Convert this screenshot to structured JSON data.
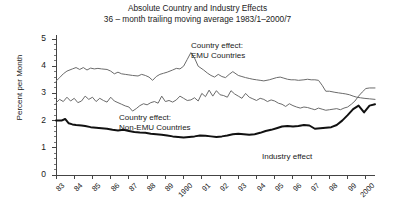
{
  "chart_data": {
    "type": "line",
    "title": "Absolute Country and Industry Effects",
    "subtitle": "36 – month trailing moving average 1983/1–2000/7",
    "xlabel": "",
    "ylabel": "Percent per Month",
    "ylim": [
      0,
      5
    ],
    "yticks": [
      0,
      1,
      2,
      3,
      4,
      5
    ],
    "ytick_labels": [
      "0",
      "1",
      "2",
      "3",
      "4",
      "5"
    ],
    "xlim": [
      1983,
      2000.5
    ],
    "xtick_labels": [
      "83",
      "84",
      "85",
      "86",
      "87",
      "88",
      "89",
      "1990",
      "91",
      "92",
      "93",
      "94",
      "95",
      "96",
      "97",
      "98",
      "99",
      "2000"
    ],
    "xticks": [
      1983,
      1984,
      1985,
      1986,
      1987,
      1988,
      1989,
      1990,
      1991,
      1992,
      1993,
      1994,
      1995,
      1996,
      1997,
      1998,
      1999,
      2000
    ],
    "grid": false,
    "legend_position": "inline-annotations",
    "annotations": [
      {
        "id": "emu",
        "text_line1": "Country effect:",
        "text_line2": "EMU Countries",
        "x": 191,
        "y": 41
      },
      {
        "id": "nonemu",
        "text_line1": "Country effect:",
        "text_line2": "Non-EMU Countries",
        "x": 119,
        "y": 113
      },
      {
        "id": "industry",
        "text_line1": "Industry effect",
        "text_line2": "",
        "x": 262,
        "y": 152
      }
    ],
    "series": [
      {
        "name": "Country effect: EMU Countries",
        "color": "#6b6b6b",
        "width": 1,
        "x": [
          1983.0,
          1983.2,
          1983.4,
          1983.6,
          1983.9,
          1984.1,
          1984.3,
          1984.5,
          1984.7,
          1984.9,
          1985.1,
          1985.3,
          1985.5,
          1985.8,
          1986.0,
          1986.2,
          1986.4,
          1986.6,
          1986.8,
          1987.0,
          1987.2,
          1987.5,
          1987.7,
          1987.9,
          1988.1,
          1988.3,
          1988.5,
          1988.7,
          1988.9,
          1989.1,
          1989.4,
          1989.6,
          1989.8,
          1990.0,
          1990.2,
          1990.4,
          1990.6,
          1990.8,
          1991.1,
          1991.3,
          1991.5,
          1991.7,
          1991.9,
          1992.1,
          1992.3,
          1992.5,
          1992.7,
          1993.0,
          1993.2,
          1993.4,
          1993.6,
          1993.8,
          1994.0,
          1994.2,
          1994.4,
          1994.7,
          1994.9,
          1995.1,
          1995.3,
          1995.5,
          1995.7,
          1995.9,
          1996.1,
          1996.3,
          1996.6,
          1996.8,
          1997.0,
          1997.2,
          1997.4,
          1997.6,
          1997.8,
          1998.0,
          1998.3,
          1998.5,
          1998.7,
          1998.9,
          1999.1,
          1999.3,
          1999.5,
          1999.7,
          1999.9,
          2000.2,
          2000.5
        ],
        "y": [
          3.45,
          3.58,
          3.72,
          3.82,
          3.9,
          3.95,
          3.88,
          3.95,
          3.86,
          3.93,
          3.9,
          3.92,
          3.9,
          3.88,
          3.82,
          3.72,
          3.78,
          3.72,
          3.7,
          3.68,
          3.66,
          3.64,
          3.7,
          3.66,
          3.6,
          3.48,
          3.62,
          3.7,
          3.74,
          3.78,
          3.86,
          3.92,
          3.9,
          4.0,
          4.25,
          4.5,
          4.3,
          4.0,
          3.86,
          3.75,
          3.66,
          3.6,
          3.7,
          3.62,
          3.58,
          3.7,
          3.8,
          3.66,
          3.62,
          3.58,
          3.55,
          3.52,
          3.5,
          3.48,
          3.46,
          3.5,
          3.54,
          3.58,
          3.6,
          3.56,
          3.52,
          3.5,
          3.5,
          3.48,
          3.5,
          3.52,
          3.5,
          3.5,
          3.48,
          3.3,
          3.08,
          3.08,
          3.04,
          3.02,
          3.0,
          2.98,
          2.95,
          2.9,
          2.86,
          2.84,
          2.82,
          2.8,
          2.78
        ]
      },
      {
        "name": "Country effect: Non-EMU Countries",
        "color": "#6b6b6b",
        "width": 1,
        "x": [
          1983.0,
          1983.2,
          1983.4,
          1983.6,
          1983.8,
          1984.0,
          1984.2,
          1984.4,
          1984.6,
          1984.8,
          1985.0,
          1985.2,
          1985.4,
          1985.6,
          1985.8,
          1986.0,
          1986.2,
          1986.4,
          1986.6,
          1986.8,
          1987.0,
          1987.2,
          1987.4,
          1987.6,
          1987.8,
          1988.0,
          1988.2,
          1988.4,
          1988.6,
          1988.8,
          1989.0,
          1989.2,
          1989.4,
          1989.6,
          1989.8,
          1990.0,
          1990.2,
          1990.4,
          1990.6,
          1990.8,
          1991.0,
          1991.2,
          1991.4,
          1991.6,
          1991.8,
          1992.0,
          1992.2,
          1992.4,
          1992.6,
          1992.8,
          1993.0,
          1993.2,
          1993.4,
          1993.6,
          1993.8,
          1994.0,
          1994.2,
          1994.4,
          1994.6,
          1994.8,
          1995.0,
          1995.2,
          1995.4,
          1995.6,
          1995.8,
          1996.0,
          1996.2,
          1996.4,
          1996.6,
          1996.8,
          1997.0,
          1997.2,
          1997.4,
          1997.6,
          1997.8,
          1998.0,
          1998.2,
          1998.4,
          1998.6,
          1998.8,
          1999.0,
          1999.2,
          1999.4,
          1999.6,
          1999.8,
          2000.0,
          2000.2,
          2000.5
        ],
        "y": [
          2.65,
          2.78,
          2.7,
          2.86,
          2.72,
          2.82,
          2.66,
          2.72,
          2.9,
          2.78,
          2.86,
          2.7,
          2.82,
          2.74,
          2.68,
          2.86,
          2.72,
          2.66,
          2.6,
          2.54,
          2.5,
          2.35,
          2.44,
          2.55,
          2.62,
          2.58,
          2.66,
          2.7,
          2.64,
          2.9,
          2.7,
          2.74,
          2.68,
          2.76,
          2.9,
          2.82,
          2.74,
          2.76,
          2.84,
          2.72,
          3.0,
          2.88,
          3.12,
          2.9,
          3.1,
          2.95,
          2.92,
          2.86,
          3.1,
          2.98,
          2.9,
          2.82,
          3.0,
          2.86,
          2.8,
          2.74,
          2.82,
          2.78,
          2.7,
          2.76,
          2.72,
          2.64,
          2.6,
          2.52,
          2.62,
          2.55,
          2.5,
          2.46,
          2.5,
          2.48,
          2.44,
          2.4,
          2.46,
          2.42,
          2.38,
          2.4,
          2.42,
          2.44,
          2.4,
          2.46,
          2.5,
          2.6,
          2.72,
          2.9,
          3.05,
          3.18,
          3.2,
          3.2
        ]
      },
      {
        "name": "Industry effect",
        "color": "#111111",
        "width": 2,
        "x": [
          1983.0,
          1983.3,
          1983.5,
          1983.7,
          1983.9,
          1984.1,
          1984.4,
          1984.6,
          1984.9,
          1985.2,
          1985.5,
          1985.8,
          1986.1,
          1986.4,
          1986.7,
          1987.0,
          1987.3,
          1987.6,
          1987.9,
          1988.2,
          1988.5,
          1988.8,
          1989.1,
          1989.4,
          1989.7,
          1990.0,
          1990.3,
          1990.6,
          1990.9,
          1991.2,
          1991.5,
          1991.8,
          1992.1,
          1992.4,
          1992.7,
          1993.0,
          1993.3,
          1993.6,
          1993.9,
          1994.2,
          1994.5,
          1994.8,
          1995.1,
          1995.4,
          1995.7,
          1996.0,
          1996.3,
          1996.6,
          1996.9,
          1997.2,
          1997.5,
          1997.8,
          1998.1,
          1998.4,
          1998.7,
          1999.0,
          1999.3,
          1999.6,
          1999.9,
          2000.2,
          2000.5
        ],
        "y": [
          2.0,
          2.0,
          2.06,
          1.9,
          1.86,
          1.84,
          1.82,
          1.8,
          1.76,
          1.74,
          1.72,
          1.7,
          1.66,
          1.64,
          1.66,
          1.62,
          1.58,
          1.56,
          1.55,
          1.52,
          1.5,
          1.48,
          1.45,
          1.42,
          1.4,
          1.38,
          1.4,
          1.42,
          1.45,
          1.44,
          1.42,
          1.4,
          1.42,
          1.45,
          1.5,
          1.52,
          1.5,
          1.48,
          1.5,
          1.55,
          1.62,
          1.66,
          1.72,
          1.78,
          1.8,
          1.78,
          1.8,
          1.84,
          1.82,
          1.7,
          1.72,
          1.74,
          1.76,
          1.84,
          2.0,
          2.2,
          2.42,
          2.55,
          2.3,
          2.55,
          2.6
        ]
      }
    ]
  }
}
